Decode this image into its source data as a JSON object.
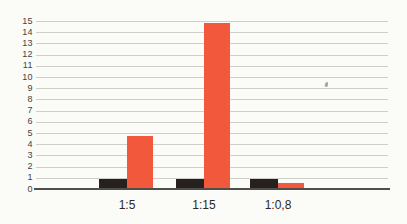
{
  "chart_data": {
    "type": "bar",
    "title": "",
    "xlabel": "",
    "ylabel": "",
    "categories": [
      "1:5",
      "1:15",
      "1:0,8"
    ],
    "series": [
      {
        "name": "dark-bars",
        "color": "#26211e",
        "values": [
          1,
          1,
          0.95
        ]
      },
      {
        "name": "orange-bars",
        "color": "#f2583c",
        "values": [
          4.8,
          14.9,
          0.65
        ]
      }
    ],
    "ylim": [
      0,
      15
    ],
    "yticks": [
      0,
      1,
      2,
      3,
      4,
      5,
      6,
      7,
      8,
      9,
      10,
      11,
      12,
      13,
      14,
      15
    ],
    "grid": true,
    "legend": "none",
    "background": "#fbfbf8",
    "axis": {
      "gridline_color": "#cfcfc9",
      "baseline_color": "#504e4a",
      "tick_label_color": "#454340",
      "category_label_color": "#2b2926"
    }
  }
}
